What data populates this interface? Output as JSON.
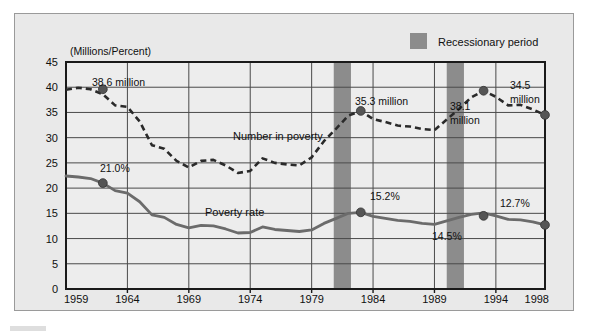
{
  "figure": {
    "unit_label": "(Millions/Percent)",
    "legend": {
      "swatch_name": "recession-swatch",
      "label": "Recessionary period",
      "color": "#8c8c8c"
    },
    "colors": {
      "panel_background": "#e9e9e9",
      "plot_background": "#ededed",
      "axis": "#1a1a1a",
      "grid": "#4a4a4a",
      "number_line": "#2a2a2a",
      "rate_line": "#6b6b6b",
      "marker": "#555555",
      "recession_band": "#8c8c8c"
    }
  },
  "chart_data": {
    "type": "line",
    "title": "",
    "xlabel": "",
    "ylabel": "(Millions/Percent)",
    "xlim": [
      1959,
      1998
    ],
    "ylim": [
      0,
      45
    ],
    "ytick_labels": [
      "0",
      "5",
      "10",
      "15",
      "20",
      "25",
      "30",
      "35",
      "40",
      "45"
    ],
    "yticks": [
      0,
      5,
      10,
      15,
      20,
      25,
      30,
      35,
      40,
      45
    ],
    "xtick_labels": [
      "1959",
      "1964",
      "1969",
      "1974",
      "1979",
      "1984",
      "1989",
      "1994",
      "1998"
    ],
    "xticks": [
      1959,
      1964,
      1969,
      1974,
      1979,
      1984,
      1989,
      1994,
      1998
    ],
    "grid": true,
    "legend_position": "top-right",
    "x": [
      1959,
      1960,
      1961,
      1962,
      1963,
      1964,
      1965,
      1966,
      1967,
      1968,
      1969,
      1970,
      1971,
      1972,
      1973,
      1974,
      1975,
      1976,
      1977,
      1978,
      1979,
      1980,
      1981,
      1982,
      1983,
      1984,
      1985,
      1986,
      1987,
      1988,
      1989,
      1990,
      1991,
      1992,
      1993,
      1994,
      1995,
      1996,
      1997,
      1998
    ],
    "series": [
      {
        "name": "Number in poverty",
        "style": "dashed",
        "units": "millions",
        "values": [
          39.5,
          39.9,
          39.6,
          38.6,
          36.4,
          36.1,
          33.2,
          28.5,
          27.8,
          25.4,
          24.1,
          25.4,
          25.6,
          24.5,
          23.0,
          23.4,
          25.9,
          25.0,
          24.7,
          24.5,
          26.1,
          29.3,
          31.8,
          34.4,
          35.3,
          33.7,
          33.1,
          32.4,
          32.2,
          31.7,
          31.5,
          33.6,
          35.7,
          38.0,
          39.3,
          38.1,
          36.4,
          36.5,
          35.6,
          34.5
        ]
      },
      {
        "name": "Poverty rate",
        "style": "solid",
        "units": "percent",
        "values": [
          22.4,
          22.2,
          21.9,
          21.0,
          19.5,
          19.0,
          17.3,
          14.7,
          14.2,
          12.8,
          12.1,
          12.6,
          12.5,
          11.9,
          11.1,
          11.2,
          12.3,
          11.8,
          11.6,
          11.4,
          11.7,
          13.0,
          14.0,
          15.0,
          15.2,
          14.4,
          14.0,
          13.6,
          13.4,
          13.0,
          12.8,
          13.5,
          14.2,
          14.8,
          15.1,
          14.5,
          13.8,
          13.7,
          13.3,
          12.7
        ]
      }
    ],
    "annotations": [
      {
        "name": "annot-38-6-million",
        "text": "38.6 million",
        "series": "Number in poverty",
        "year": 1962,
        "value": 39.6,
        "marker": true
      },
      {
        "name": "annot-35-3-million",
        "text": "35.3 million",
        "series": "Number in poverty",
        "year": 1983,
        "value": 35.3,
        "marker": true
      },
      {
        "name": "annot-38-1-million",
        "text": "38.1",
        "text2": "million",
        "series": "Number in poverty",
        "year": 1993,
        "value": 39.3,
        "marker": true
      },
      {
        "name": "annot-34-5-million",
        "text": "34.5",
        "text2": "million",
        "series": "Number in poverty",
        "year": 1998,
        "value": 34.5,
        "marker": true
      },
      {
        "name": "annot-21-0-percent",
        "text": "21.0%",
        "series": "Poverty rate",
        "year": 1962,
        "value": 21.0,
        "marker": true
      },
      {
        "name": "annot-15-2-percent",
        "text": "15.2%",
        "series": "Poverty rate",
        "year": 1983,
        "value": 15.2,
        "marker": true
      },
      {
        "name": "annot-14-5-percent",
        "text": "14.5%",
        "series": "Poverty rate",
        "year": 1993,
        "value": 14.5,
        "marker": true
      },
      {
        "name": "annot-12-7-percent",
        "text": "12.7%",
        "series": "Poverty rate",
        "year": 1998,
        "value": 12.7,
        "marker": true
      }
    ],
    "series_inline_labels": [
      {
        "name": "label-number-in-poverty",
        "text": "Number in poverty"
      },
      {
        "name": "label-poverty-rate",
        "text": "Poverty rate"
      }
    ],
    "recession_bands": [
      {
        "name": "recession-band-1",
        "start": 1980.8,
        "end": 1982.2
      },
      {
        "name": "recession-band-2",
        "start": 1990.0,
        "end": 1991.4
      }
    ]
  }
}
